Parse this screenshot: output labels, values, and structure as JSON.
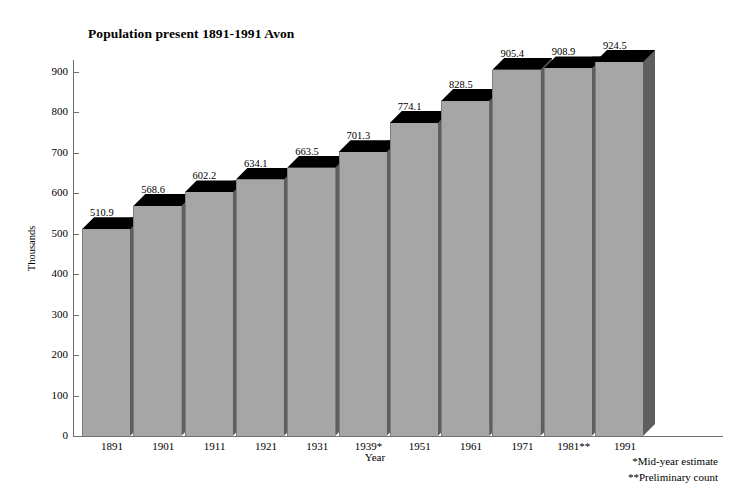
{
  "chart_data": {
    "type": "bar",
    "title": "Population present 1891-1991 Avon",
    "xlabel": "Year",
    "ylabel": "Thousands",
    "categories": [
      "1891",
      "1901",
      "1911",
      "1921",
      "1931",
      "1939*",
      "1951",
      "1961",
      "1971",
      "1981**",
      "1991"
    ],
    "values": [
      510.9,
      568.6,
      602.2,
      634.1,
      663.5,
      701.3,
      774.1,
      828.5,
      905.4,
      908.9,
      924.5
    ],
    "data_labels": [
      "510.9",
      "568.6",
      "602.2",
      "634.1",
      "663.5",
      "701.3",
      "774.1",
      "828.5",
      "905.4",
      "908.9",
      "924.5"
    ],
    "ylim": [
      0,
      900
    ],
    "y_ticks": [
      0,
      100,
      200,
      300,
      400,
      500,
      600,
      700,
      800,
      900
    ],
    "y_tick_labels": [
      "0",
      "100",
      "200",
      "300",
      "400",
      "500",
      "600",
      "700",
      "800",
      "900"
    ],
    "grid": false,
    "legend": false,
    "style": "3d-column",
    "colors": {
      "bar_front": "#a6a6a6",
      "bar_side": "#5e5e5e",
      "bar_top": "#000000",
      "axis": "#6f6f6f",
      "text": "#000000",
      "background": "#ffffff"
    },
    "annotations": [
      "*Mid-year estimate",
      "**Preliminary count"
    ]
  },
  "footnotes": {
    "mid_year": "*Mid-year estimate",
    "preliminary": "**Preliminary count"
  }
}
